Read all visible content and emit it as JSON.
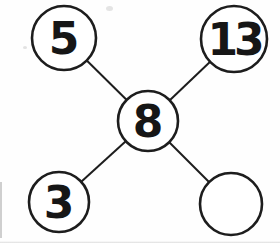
{
  "diagram": {
    "type": "number-bond",
    "background_color": "#fefefe",
    "node_fill_color": "#ffffff",
    "stroke_color": "#1d1d1d",
    "text_color": "#161616",
    "circle_stroke_width": 2.6,
    "edge_stroke_width": 2,
    "font_size": 44,
    "center_node": {
      "id": "center",
      "value": "8",
      "x": 148,
      "y": 121,
      "r": 30
    },
    "outer_nodes": [
      {
        "id": "top-left",
        "value": "5",
        "x": 64,
        "y": 38,
        "r": 32
      },
      {
        "id": "top-right",
        "value": "13",
        "x": 234,
        "y": 39,
        "r": 33
      },
      {
        "id": "bottom-left",
        "value": "3",
        "x": 59,
        "y": 202,
        "r": 30
      },
      {
        "id": "bottom-right",
        "value": "",
        "x": 231,
        "y": 204,
        "r": 31
      }
    ],
    "edges": [
      [
        "center",
        "top-left"
      ],
      [
        "center",
        "top-right"
      ],
      [
        "center",
        "bottom-left"
      ],
      [
        "center",
        "bottom-right"
      ]
    ]
  }
}
